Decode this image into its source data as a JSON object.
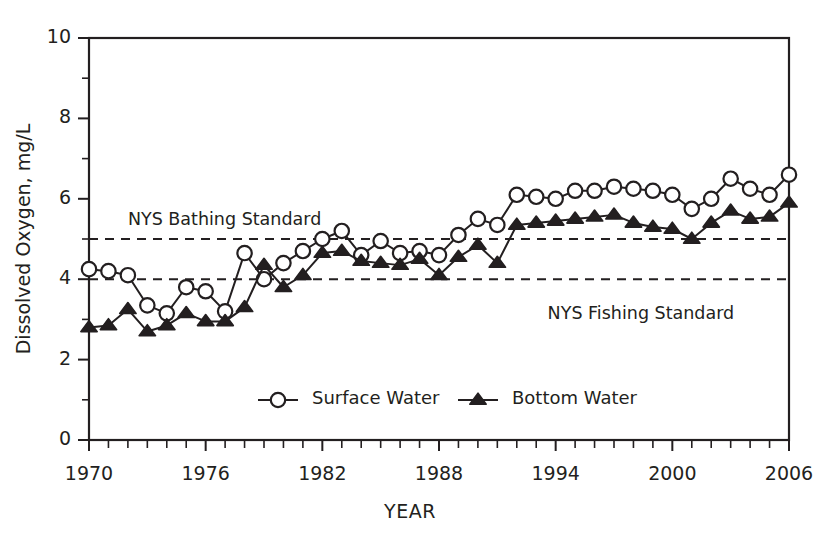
{
  "chart_data": {
    "type": "line",
    "title": "",
    "xlabel": "YEAR",
    "ylabel": "Dissolved Oxygen, mg/L",
    "xlim": [
      1970,
      2006
    ],
    "ylim": [
      0,
      10
    ],
    "grid": false,
    "legend_position": "inside-bottom-center",
    "x_major_ticks": [
      1970,
      1976,
      1982,
      1988,
      1994,
      2000,
      2006
    ],
    "x_major_tick_labels": [
      "1970",
      "1976",
      "1982",
      "1988",
      "1994",
      "2000",
      "2006"
    ],
    "x_minor_tick_step": 1,
    "y_major_ticks": [
      0,
      2,
      4,
      6,
      8,
      10
    ],
    "y_major_tick_labels": [
      "0",
      "2",
      "4",
      "6",
      "8",
      "10"
    ],
    "y_minor_ticks": [
      1,
      3,
      5,
      7,
      9
    ],
    "x": [
      1970,
      1971,
      1972,
      1973,
      1974,
      1975,
      1976,
      1977,
      1978,
      1979,
      1980,
      1981,
      1982,
      1983,
      1984,
      1985,
      1986,
      1987,
      1988,
      1989,
      1990,
      1991,
      1992,
      1993,
      1994,
      1995,
      1996,
      1997,
      1998,
      1999,
      2000,
      2001,
      2002,
      2003,
      2004,
      2005,
      2006
    ],
    "series": [
      {
        "name": "Surface Water",
        "marker": "open-circle",
        "values": [
          4.25,
          4.2,
          4.1,
          3.35,
          3.15,
          3.8,
          3.7,
          3.2,
          4.65,
          4.0,
          4.4,
          4.7,
          5.0,
          5.2,
          4.6,
          4.95,
          4.65,
          4.7,
          4.6,
          5.1,
          5.5,
          5.35,
          6.1,
          6.05,
          6.0,
          6.2,
          6.2,
          6.3,
          6.25,
          6.2,
          6.1,
          5.75,
          6.0,
          6.5,
          6.25,
          6.1,
          6.6
        ]
      },
      {
        "name": "Bottom Water",
        "marker": "filled-triangle",
        "values": [
          2.8,
          2.85,
          3.25,
          2.7,
          2.85,
          3.15,
          2.95,
          2.95,
          3.3,
          4.35,
          3.8,
          4.1,
          4.65,
          4.7,
          4.45,
          4.4,
          4.35,
          4.5,
          4.1,
          4.55,
          4.85,
          4.4,
          5.35,
          5.4,
          5.45,
          5.5,
          5.55,
          5.6,
          5.4,
          5.3,
          5.25,
          5.0,
          5.4,
          5.7,
          5.5,
          5.55,
          5.9
        ]
      }
    ],
    "reference_lines": [
      {
        "label": "NYS Bathing Standard",
        "value": 5.0,
        "style": "dashed",
        "label_x": 1972.0,
        "label_anchor": "start"
      },
      {
        "label": "NYS Fishing Standard",
        "value": 4.0,
        "style": "dashed",
        "label_x": 1999.5,
        "label_anchor": "start"
      }
    ],
    "legend": [
      {
        "label": "Surface Water",
        "marker": "open-circle"
      },
      {
        "label": "Bottom Water",
        "marker": "filled-triangle"
      }
    ],
    "colors": {
      "ink": "#231f20",
      "text": "#3b3b3b",
      "background": "#ffffff",
      "marker_fill_surface": "#ffffff",
      "marker_fill_bottom": "#231f20"
    }
  }
}
